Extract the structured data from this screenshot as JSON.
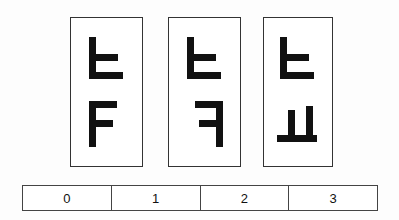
{
  "page": {
    "background_color": "#fdfdfd",
    "ink_color": "#111111",
    "border_color": "#333333"
  },
  "cards": [
    {
      "name": "card-0",
      "x": 70,
      "y": 17,
      "width": 73,
      "height": 150,
      "glyphs": [
        {
          "name": "glyph-tieut",
          "label": "ㅌ",
          "strokes": [
            {
              "x": 2,
              "y": 0,
              "w": 7,
              "h": 42
            },
            {
              "x": 2,
              "y": 17,
              "w": 29,
              "h": 7
            },
            {
              "x": 2,
              "y": 35,
              "w": 34,
              "h": 7
            }
          ],
          "viewbox": "0 0 40 44"
        },
        {
          "name": "glyph-f-shape",
          "label": "ㅏ-rotated",
          "strokes": [
            {
              "x": 2,
              "y": 0,
              "w": 7,
              "h": 46
            },
            {
              "x": 2,
              "y": 0,
              "w": 28,
              "h": 7
            },
            {
              "x": 2,
              "y": 19,
              "w": 24,
              "h": 7
            }
          ],
          "viewbox": "0 0 40 48"
        }
      ]
    },
    {
      "name": "card-1",
      "x": 168,
      "y": 17,
      "width": 73,
      "height": 150,
      "glyphs": [
        {
          "name": "glyph-tieut",
          "label": "ㅌ",
          "strokes": [
            {
              "x": 2,
              "y": 0,
              "w": 7,
              "h": 42
            },
            {
              "x": 2,
              "y": 17,
              "w": 29,
              "h": 7
            },
            {
              "x": 2,
              "y": 35,
              "w": 34,
              "h": 7
            }
          ],
          "viewbox": "0 0 40 44"
        },
        {
          "name": "glyph-kieuk",
          "label": "ㅋ",
          "strokes": [
            {
              "x": 31,
              "y": 0,
              "w": 7,
              "h": 46
            },
            {
              "x": 10,
              "y": 0,
              "w": 28,
              "h": 7
            },
            {
              "x": 14,
              "y": 19,
              "w": 24,
              "h": 7
            }
          ],
          "viewbox": "0 0 40 48"
        }
      ]
    },
    {
      "name": "card-2",
      "x": 263,
      "y": 17,
      "width": 70,
      "height": 150,
      "glyphs": [
        {
          "name": "glyph-tieut",
          "label": "ㅌ",
          "strokes": [
            {
              "x": 2,
              "y": 0,
              "w": 7,
              "h": 42
            },
            {
              "x": 2,
              "y": 17,
              "w": 29,
              "h": 7
            },
            {
              "x": 2,
              "y": 35,
              "w": 34,
              "h": 7
            }
          ],
          "viewbox": "0 0 40 44"
        },
        {
          "name": "glyph-yo",
          "label": "ㅛ",
          "strokes": [
            {
              "x": 11,
              "y": 4,
              "w": 7,
              "h": 26
            },
            {
              "x": 29,
              "y": 0,
              "w": 7,
              "h": 30
            },
            {
              "x": 0,
              "y": 29,
              "w": 40,
              "h": 7
            }
          ],
          "viewbox": "0 0 42 38"
        }
      ]
    }
  ],
  "answer_bar": {
    "name": "answer-bar",
    "cells": [
      {
        "label": "0"
      },
      {
        "label": "1"
      },
      {
        "label": "2"
      },
      {
        "label": "3"
      }
    ]
  }
}
